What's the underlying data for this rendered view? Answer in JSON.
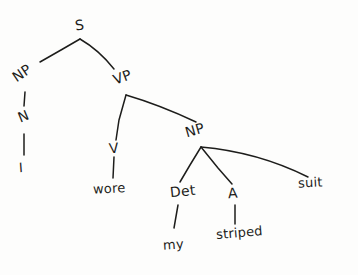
{
  "diagram": {
    "kind": "hand-drawn-syntax-tree",
    "sentence": "I wore my striped suit",
    "ink_color": "#1d1d1b",
    "background_color": "#fdfdfc",
    "nodes": {
      "s": "S",
      "np_subject": "NP",
      "n": "N",
      "i": "I",
      "vp": "VP",
      "v": "V",
      "wore": "wore",
      "np_object": "NP",
      "det": "Det",
      "my": "my",
      "a": "A",
      "striped": "striped",
      "suit": "suit"
    }
  }
}
